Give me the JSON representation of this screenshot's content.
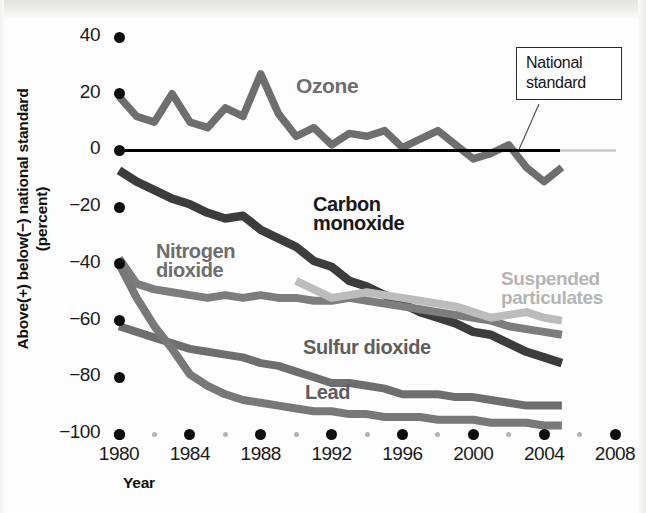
{
  "chart_data": {
    "type": "line",
    "title": "",
    "xlabel": "Year",
    "ylabel": "Above(+) below(−) national standard (percent)",
    "ylabel_line1": "Above(+) below(−) national standard",
    "ylabel_line2": "(percent)",
    "xlim": [
      1980,
      2008
    ],
    "ylim": [
      -100,
      40
    ],
    "grid": false,
    "legend_position": "inline-labels",
    "x_ticks": [
      "1980",
      "1984",
      "1988",
      "1992",
      "1996",
      "2000",
      "2004",
      "2008"
    ],
    "x_tick_values": [
      1980,
      1984,
      1988,
      1992,
      1996,
      2000,
      2004,
      2008
    ],
    "x_minor_ticks": [
      1982,
      1986,
      1990,
      1994,
      1998,
      2002,
      2006
    ],
    "y_ticks": [
      "40",
      "20",
      "0",
      "−20",
      "−40",
      "−60",
      "−80",
      "−100"
    ],
    "y_tick_values": [
      40,
      20,
      0,
      -20,
      -40,
      -60,
      -80,
      -100
    ],
    "reference_line": {
      "label": "National standard",
      "label_line1": "National",
      "label_line2": "standard",
      "value": 0,
      "color": "#000000"
    },
    "x": [
      1980,
      1981,
      1982,
      1983,
      1984,
      1985,
      1986,
      1987,
      1988,
      1989,
      1990,
      1991,
      1992,
      1993,
      1994,
      1995,
      1996,
      1997,
      1998,
      1999,
      2000,
      2001,
      2002,
      2003,
      2004,
      2005
    ],
    "series": [
      {
        "name": "Ozone",
        "color": "#6e6e6e",
        "label_color": "#6e6e6e",
        "values": [
          19,
          12,
          10,
          20,
          10,
          8,
          15,
          12,
          27,
          13,
          5,
          8,
          2,
          6,
          5,
          7,
          1,
          4,
          7,
          2,
          -3,
          -1,
          2,
          -6,
          -11,
          -6
        ]
      },
      {
        "name": "Carbon monoxide",
        "label_line1": "Carbon",
        "label_line2": "monoxide",
        "color": "#3c3c3c",
        "label_color": "#181818",
        "values": [
          -7,
          -11,
          -14,
          -17,
          -19,
          -22,
          -24,
          -23,
          -28,
          -31,
          -34,
          -39,
          -41,
          -46,
          -48,
          -51,
          -54,
          -57,
          -59,
          -61,
          -64,
          -65,
          -68,
          -71,
          -73,
          -75
        ]
      },
      {
        "name": "Nitrogen dioxide",
        "label_line1": "Nitrogen",
        "label_line2": "dioxide",
        "color": "#7d7d7d",
        "label_color": "#6e6e6e",
        "values": [
          -38,
          -47,
          -49,
          -50,
          -51,
          -52,
          -51,
          -52,
          -51,
          -52,
          -52,
          -53,
          -53,
          -52,
          -53,
          -54,
          -55,
          -56,
          -57,
          -58,
          -59,
          -60,
          -62,
          -63,
          -64,
          -65
        ]
      },
      {
        "name": "Suspended particulates",
        "label_line1": "Suspended",
        "label_line2": "particulates",
        "color": "#bcbcbc",
        "label_color": "#b5b5b5",
        "values": [
          null,
          null,
          null,
          null,
          null,
          null,
          null,
          null,
          null,
          null,
          -46,
          -49,
          -52,
          -51,
          -50,
          -51,
          -52,
          -53,
          -54,
          -55,
          -57,
          -59,
          -58,
          -57,
          -59,
          -60
        ]
      },
      {
        "name": "Sulfur dioxide",
        "color": "#6e6e6e",
        "label_color": "#5e5e5e",
        "values": [
          -62,
          -64,
          -66,
          -68,
          -70,
          -71,
          -72,
          -73,
          -75,
          -76,
          -78,
          -80,
          -82,
          -82,
          -83,
          -84,
          -86,
          -86,
          -86,
          -87,
          -87,
          -88,
          -89,
          -90,
          -90,
          -90
        ]
      },
      {
        "name": "Lead",
        "color": "#787878",
        "label_color": "#5e5e5e",
        "values": [
          -40,
          -52,
          -62,
          -70,
          -79,
          -83,
          -86,
          -88,
          -89,
          -90,
          -91,
          -92,
          -92,
          -93,
          -93,
          -94,
          -94,
          -94,
          -95,
          -95,
          -95,
          -96,
          -96,
          -96,
          -97,
          -97
        ]
      }
    ]
  },
  "axis_title_x": "Year"
}
